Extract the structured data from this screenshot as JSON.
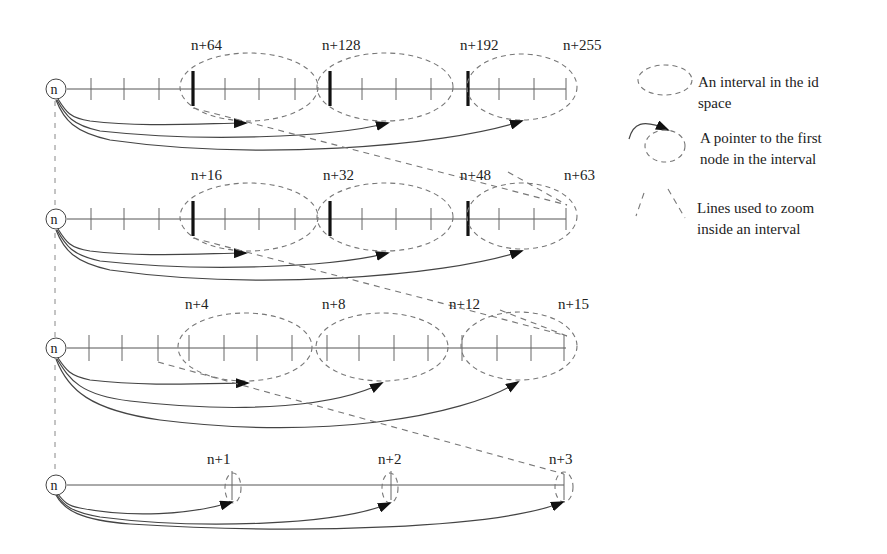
{
  "diagram": {
    "rows": [
      {
        "id": "row-1",
        "node_label": "n",
        "interval_labels": [
          "n+64",
          "n+128",
          "n+192",
          "n+255"
        ]
      },
      {
        "id": "row-2",
        "node_label": "n",
        "interval_labels": [
          "n+16",
          "n+32",
          "n+48",
          "n+63"
        ]
      },
      {
        "id": "row-3",
        "node_label": "n",
        "interval_labels": [
          "n+4",
          "n+8",
          "n+12",
          "n+15"
        ]
      },
      {
        "id": "row-4",
        "node_label": "n",
        "interval_labels": [
          "n+1",
          "n+2",
          "n+3"
        ]
      }
    ],
    "legend": {
      "items": [
        {
          "icon": "dashed-ellipse-icon",
          "text_line1": "An interval in the id",
          "text_line2": "space"
        },
        {
          "icon": "pointer-arrow-icon",
          "text_line1": "A pointer to the first",
          "text_line2": "node in the interval"
        },
        {
          "icon": "zoom-lines-icon",
          "text_line1": "Lines used to zoom",
          "text_line2": "inside an interval"
        }
      ]
    },
    "colors": {
      "line": "#444444",
      "dashed": "#777777",
      "background": "#ffffff"
    }
  }
}
